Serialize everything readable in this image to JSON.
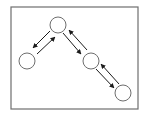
{
  "diagram": {
    "type": "graph",
    "frame": {
      "x": 11,
      "y": 7,
      "width": 127,
      "height": 102,
      "stroke": "#6e6e6e"
    },
    "colors": {
      "node_fill": "#ffffff",
      "node_stroke": "#6e6e6e",
      "arrow": "#1a1a1a"
    },
    "nodes": [
      {
        "id": "top",
        "cx": 58,
        "cy": 25,
        "r": 8
      },
      {
        "id": "left",
        "cx": 27,
        "cy": 61,
        "r": 8
      },
      {
        "id": "middle-right",
        "cx": 91,
        "cy": 61,
        "r": 8
      },
      {
        "id": "bottom-right",
        "cx": 123,
        "cy": 93,
        "r": 8
      }
    ],
    "edges": [
      {
        "from": "top",
        "to": "left",
        "x1": 50,
        "y1": 31,
        "x2": 33,
        "y2": 48
      },
      {
        "from": "left",
        "to": "top",
        "x1": 37,
        "y1": 54,
        "x2": 55,
        "y2": 37
      },
      {
        "from": "top",
        "to": "middle-right",
        "x1": 63,
        "y1": 33,
        "x2": 81,
        "y2": 54
      },
      {
        "from": "middle-right",
        "to": "top",
        "x1": 87,
        "y1": 50,
        "x2": 69,
        "y2": 30
      },
      {
        "from": "middle-right",
        "to": "bottom-right",
        "x1": 96,
        "y1": 69,
        "x2": 114,
        "y2": 88
      },
      {
        "from": "bottom-right",
        "to": "middle-right",
        "x1": 119,
        "y1": 84,
        "x2": 101,
        "y2": 64
      }
    ]
  }
}
